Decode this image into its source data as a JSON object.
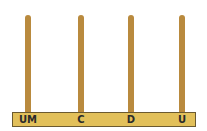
{
  "abacus": {
    "rod_color": "#b98a3e",
    "base_color": "#e2c05a",
    "rods": [
      {
        "label": "UM",
        "x": 28
      },
      {
        "label": "C",
        "x": 81
      },
      {
        "label": "D",
        "x": 131
      },
      {
        "label": "U",
        "x": 182
      }
    ]
  }
}
